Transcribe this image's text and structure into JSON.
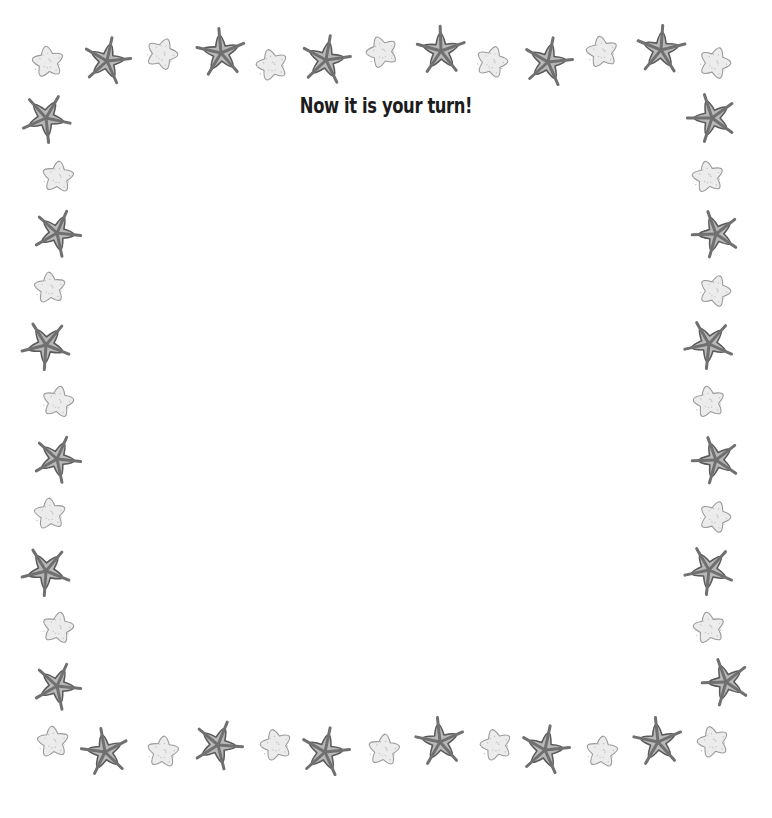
{
  "page": {
    "title": "Now it is your turn!",
    "colors": {
      "background": "#ffffff",
      "title_text": "#1c1c1c",
      "dark_star_fill": "#b8b8b8",
      "dark_star_stroke": "#5a5a5a",
      "dark_star_ridge": "#707070",
      "light_star_fill": "#ececec",
      "light_star_stroke": "#9a9a9a"
    }
  },
  "border": {
    "icon": "starfish-icon",
    "pattern": "alternating dark ridged starfish and light speckled starfish",
    "stars": [
      {
        "x": 48,
        "y": 62,
        "r": 24,
        "type": "light",
        "rot": -8
      },
      {
        "x": 107,
        "y": 61,
        "r": 28,
        "type": "dark",
        "rot": 12
      },
      {
        "x": 162,
        "y": 54,
        "r": 24,
        "type": "light",
        "rot": 20
      },
      {
        "x": 221,
        "y": 53,
        "r": 29,
        "type": "dark",
        "rot": -5
      },
      {
        "x": 272,
        "y": 65,
        "r": 24,
        "type": "light",
        "rot": -15
      },
      {
        "x": 326,
        "y": 60,
        "r": 29,
        "type": "dark",
        "rot": 10
      },
      {
        "x": 382,
        "y": 52,
        "r": 24,
        "type": "light",
        "rot": -20
      },
      {
        "x": 441,
        "y": 51,
        "r": 29,
        "type": "dark",
        "rot": -2
      },
      {
        "x": 492,
        "y": 62,
        "r": 24,
        "type": "light",
        "rot": 15
      },
      {
        "x": 548,
        "y": 62,
        "r": 29,
        "type": "dark",
        "rot": 12
      },
      {
        "x": 602,
        "y": 52,
        "r": 24,
        "type": "light",
        "rot": -10
      },
      {
        "x": 661,
        "y": 50,
        "r": 29,
        "type": "dark",
        "rot": 4
      },
      {
        "x": 715,
        "y": 63,
        "r": 24,
        "type": "light",
        "rot": 18
      },
      {
        "x": 46,
        "y": 118,
        "r": 29,
        "type": "dark",
        "rot": 30
      },
      {
        "x": 58,
        "y": 177,
        "r": 24,
        "type": "light",
        "rot": 5
      },
      {
        "x": 57,
        "y": 233,
        "r": 28,
        "type": "dark",
        "rot": 24
      },
      {
        "x": 50,
        "y": 288,
        "r": 24,
        "type": "light",
        "rot": -5
      },
      {
        "x": 46,
        "y": 345,
        "r": 29,
        "type": "dark",
        "rot": 40
      },
      {
        "x": 58,
        "y": 402,
        "r": 24,
        "type": "light",
        "rot": 10
      },
      {
        "x": 57,
        "y": 459,
        "r": 28,
        "type": "dark",
        "rot": 24
      },
      {
        "x": 50,
        "y": 514,
        "r": 24,
        "type": "light",
        "rot": -5
      },
      {
        "x": 46,
        "y": 571,
        "r": 29,
        "type": "dark",
        "rot": 40
      },
      {
        "x": 58,
        "y": 628,
        "r": 24,
        "type": "light",
        "rot": 10
      },
      {
        "x": 57,
        "y": 686,
        "r": 28,
        "type": "dark",
        "rot": 24
      },
      {
        "x": 53,
        "y": 742,
        "r": 24,
        "type": "light",
        "rot": -5
      },
      {
        "x": 105,
        "y": 752,
        "r": 28,
        "type": "dark",
        "rot": -10
      },
      {
        "x": 163,
        "y": 752,
        "r": 24,
        "type": "light",
        "rot": 5
      },
      {
        "x": 218,
        "y": 745,
        "r": 29,
        "type": "dark",
        "rot": 22
      },
      {
        "x": 276,
        "y": 745,
        "r": 24,
        "type": "light",
        "rot": -15
      },
      {
        "x": 325,
        "y": 752,
        "r": 29,
        "type": "dark",
        "rot": 12
      },
      {
        "x": 384,
        "y": 750,
        "r": 24,
        "type": "light",
        "rot": 5
      },
      {
        "x": 440,
        "y": 742,
        "r": 29,
        "type": "dark",
        "rot": -6
      },
      {
        "x": 496,
        "y": 745,
        "r": 24,
        "type": "light",
        "rot": -15
      },
      {
        "x": 545,
        "y": 750,
        "r": 29,
        "type": "dark",
        "rot": 12
      },
      {
        "x": 602,
        "y": 752,
        "r": 24,
        "type": "light",
        "rot": 5
      },
      {
        "x": 658,
        "y": 742,
        "r": 29,
        "type": "dark",
        "rot": -6
      },
      {
        "x": 713,
        "y": 742,
        "r": 24,
        "type": "light",
        "rot": -15
      },
      {
        "x": 712,
        "y": 118,
        "r": 29,
        "type": "dark",
        "rot": -18
      },
      {
        "x": 708,
        "y": 177,
        "r": 24,
        "type": "light",
        "rot": -10
      },
      {
        "x": 716,
        "y": 234,
        "r": 28,
        "type": "dark",
        "rot": -20
      },
      {
        "x": 715,
        "y": 291,
        "r": 24,
        "type": "light",
        "rot": 18
      },
      {
        "x": 709,
        "y": 344,
        "r": 29,
        "type": "dark",
        "rot": -30
      },
      {
        "x": 709,
        "y": 402,
        "r": 24,
        "type": "light",
        "rot": -10
      },
      {
        "x": 716,
        "y": 460,
        "r": 28,
        "type": "dark",
        "rot": -20
      },
      {
        "x": 715,
        "y": 517,
        "r": 24,
        "type": "light",
        "rot": 18
      },
      {
        "x": 709,
        "y": 570,
        "r": 29,
        "type": "dark",
        "rot": -30
      },
      {
        "x": 709,
        "y": 628,
        "r": 24,
        "type": "light",
        "rot": -10
      },
      {
        "x": 726,
        "y": 682,
        "r": 28,
        "type": "dark",
        "rot": -20
      }
    ]
  }
}
